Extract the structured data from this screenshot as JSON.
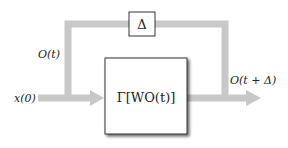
{
  "diagram": {
    "input_label": "x(0)",
    "feedback_label": "O(t)",
    "output_label": "O(t + Δ)",
    "delay_label": "Δ",
    "block_label": "Γ[WO(t)]"
  },
  "colors": {
    "arrow": "#c8c8c8",
    "box_border": "#333333",
    "box_fill": "#ffffff",
    "shadow": "#8a8a8a"
  }
}
